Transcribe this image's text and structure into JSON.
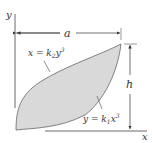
{
  "diagram": {
    "axes": {
      "x_label": "x",
      "y_label": "y"
    },
    "dimensions": {
      "width_label": "a",
      "height_label": "h"
    },
    "curves": {
      "upper": {
        "label_lhs": "x = k",
        "sub": "2",
        "var": "y",
        "sup": "3"
      },
      "lower": {
        "label_lhs": "y = k",
        "sub": "1",
        "var": "x",
        "sup": "3"
      }
    },
    "colors": {
      "fill": "#d9d9d9",
      "stroke": "#555555",
      "line": "#444444"
    }
  }
}
